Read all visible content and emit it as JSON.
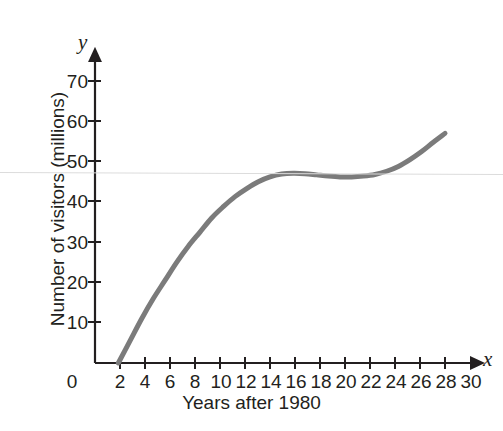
{
  "chart_data": {
    "type": "line",
    "title": "",
    "subtitle": "",
    "xlabel": "Years after 1980",
    "ylabel": "Number of visitors (millions)",
    "x_axis_letter": "x",
    "y_axis_letter": "y",
    "xlim": [
      0,
      31.5
    ],
    "ylim": [
      0,
      75
    ],
    "grid": false,
    "legend": null,
    "x_ticks": [
      0,
      2,
      4,
      6,
      8,
      10,
      12,
      14,
      16,
      18,
      20,
      22,
      24,
      26,
      28,
      30
    ],
    "x_tick_labels": [
      "0",
      "2",
      "4",
      "6",
      "8",
      "10",
      "12",
      "14",
      "16",
      "18",
      "20",
      "22",
      "24",
      "26",
      "28",
      "30"
    ],
    "y_ticks": [
      10,
      20,
      30,
      40,
      50,
      60,
      70
    ],
    "y_tick_labels": [
      "10",
      "20",
      "30",
      "40",
      "50",
      "60",
      "70"
    ],
    "series": [
      {
        "name": "Number of visitors",
        "color": "#7b7b7b",
        "line_width": 5,
        "x": [
          2,
          3,
          4,
          5,
          6,
          7,
          8,
          9,
          10,
          11,
          12,
          13,
          14,
          15,
          16,
          17,
          18,
          19,
          20,
          21,
          22,
          23,
          24,
          25,
          26,
          27,
          28,
          29,
          30
        ],
        "values": [
          0,
          5.5,
          11,
          16,
          20.5,
          25,
          29,
          32.5,
          36,
          38.8,
          41.3,
          43.3,
          45,
          46.2,
          46.9,
          47.1,
          47.0,
          46.7,
          46.4,
          46.2,
          46.2,
          46.4,
          46.8,
          47.6,
          48.8,
          50.5,
          52.5,
          54.8,
          57.0
        ]
      }
    ],
    "annotations": [
      {
        "name": "scan-artifact-line",
        "type": "horizontal-line",
        "y": 49,
        "color": "#dcdcdc"
      }
    ]
  },
  "axes": {
    "x_arrow": true,
    "y_arrow": true,
    "axis_color": "#231f20"
  }
}
